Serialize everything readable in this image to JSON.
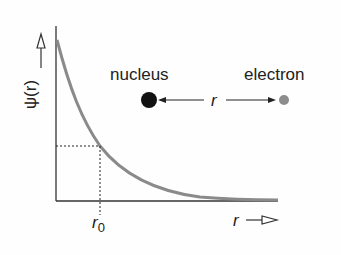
{
  "diagram": {
    "y_axis_label": "ψ(r)",
    "x_axis_label": "r",
    "marker_label": "r",
    "marker_subscript": "0",
    "nucleus_label": "nucleus",
    "electron_label": "electron",
    "distance_label": "r",
    "colors": {
      "axis": "#333333",
      "curve": "#8a8a8a",
      "nucleus": "#111111",
      "electron": "#8c8c8c",
      "text": "#222222"
    },
    "curve": {
      "description": "exponentially decaying wavefunction ψ(r) vs r",
      "points": [
        [
          56,
          40
        ],
        [
          70,
          82
        ],
        [
          85,
          118
        ],
        [
          100,
          146
        ],
        [
          130,
          175
        ],
        [
          160,
          188
        ],
        [
          200,
          196
        ],
        [
          240,
          199
        ],
        [
          278,
          200
        ]
      ]
    }
  }
}
